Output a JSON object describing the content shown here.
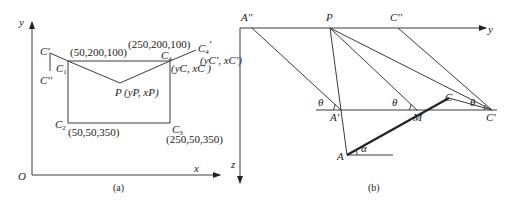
{
  "figure": {
    "caption": "",
    "panels": [
      {
        "id": "a",
        "label": "(a)"
      },
      {
        "id": "b",
        "label": "(b)"
      }
    ]
  },
  "panel_a": {
    "axes": {
      "origin": "O",
      "x": "x",
      "y": "y"
    },
    "points": {
      "c_prime": "C'",
      "c_double_prime": "C''",
      "c1": "C",
      "c1_sub": "1",
      "c2": "C",
      "c2_sub": "2",
      "c3": "C",
      "c3_sub": "3",
      "c4": "C",
      "c4_sub": "4",
      "c4_prime": "C",
      "c4_prime_sub": "4",
      "c4_prime_mark": "'",
      "p": "P"
    },
    "coords": {
      "c1": "(50,200,100)",
      "c4": "(250,200,100)",
      "c2": "(50,50,350)",
      "c3": "(250,50,350)",
      "p": "(yP, xP)",
      "c4_local": "(yC, xC )",
      "c4_prime_local": "(yC', xC')"
    },
    "label": "(a)"
  },
  "panel_b": {
    "axes": {
      "y": "y",
      "z": "z"
    },
    "points": {
      "a_double_prime": "A''",
      "p": "P",
      "c_double_prime": "C''",
      "a_prime": "A'",
      "m": "M",
      "c_prime": "C'",
      "c": "C",
      "a": "A"
    },
    "angles": {
      "theta": "θ",
      "alpha": "α"
    },
    "label": "(b)"
  }
}
